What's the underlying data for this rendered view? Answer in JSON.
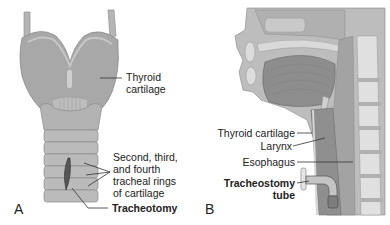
{
  "panel_a": {
    "letter": "A",
    "labels": {
      "thyroid_1": "Thyroid",
      "thyroid_2": "cartilage",
      "rings_1": "Second, third,",
      "rings_2": "and fourth",
      "rings_3": "tracheal rings",
      "rings_4": "of cartilage",
      "tracheotomy": "Tracheotomy"
    }
  },
  "panel_b": {
    "letter": "B",
    "labels": {
      "thyroid": "Thyroid cartilage",
      "larynx": "Larynx",
      "esophagus": "Esophagus",
      "tube_1": "Tracheostomy",
      "tube_2": "tube"
    }
  },
  "colors": {
    "cartilage": "#a9a9a9",
    "cartilage_light": "#c8c8c8",
    "tissue_dark": "#8a8a8a",
    "bone": "#dcdcdc",
    "line": "#333333"
  }
}
